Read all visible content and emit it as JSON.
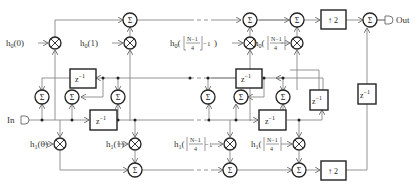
{
  "diagram": {
    "input_label": "In",
    "output_label": "Out",
    "delay_label": "z",
    "delay_exp": "−1",
    "sum_symbol": "Σ",
    "mult_symbol": "×",
    "upsample_label": "2",
    "upsample_arrow": "↑",
    "coeffs_top": [
      {
        "base": "h",
        "sub": "0",
        "arg": "(0)"
      },
      {
        "base": "h",
        "sub": "0",
        "arg": "(1)"
      },
      {
        "base": "h",
        "sub": "0",
        "arg": "(⌊(N−1)/4⌋−1)"
      },
      {
        "base": "h",
        "sub": "0",
        "arg": "(⌊(N−1)/4⌋)"
      }
    ],
    "coeffs_bottom": [
      {
        "base": "h",
        "sub": "1",
        "arg": "(0)"
      },
      {
        "base": "h",
        "sub": "1",
        "arg": "(1)"
      },
      {
        "base": "h",
        "sub": "1",
        "arg": "(⌊(N−1)/4⌋−1)"
      },
      {
        "base": "h",
        "sub": "1",
        "arg": "(⌊(N−1)/4⌋)"
      }
    ],
    "frac_num": "N−1",
    "frac_den": "4",
    "minus_one": "−1"
  }
}
